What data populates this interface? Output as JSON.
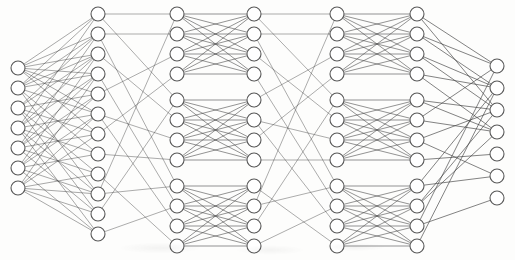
{
  "figure": {
    "caption": "",
    "width": 515,
    "height": 260,
    "background_color": "#fdfdfc",
    "node_fill": "#ffffff",
    "node_stroke": "#585858",
    "edge_color": "#3a3a3a"
  },
  "network": {
    "layer_count": 7,
    "layer_sizes": [
      7,
      12,
      12,
      12,
      12,
      12,
      7
    ],
    "node_radius": 7,
    "layers": [
      {
        "name": "input-layer",
        "role": "input",
        "node_count": 7,
        "x": 18,
        "y_start": 68,
        "y_step": 20,
        "group_gaps": []
      },
      {
        "name": "hidden-layer-1",
        "role": "hidden",
        "node_count": 12,
        "x": 98,
        "y_start": 14,
        "y_step": 20,
        "group_gaps": []
      },
      {
        "name": "hidden-layer-2",
        "role": "hidden",
        "node_count": 12,
        "x": 177,
        "y_start": 14,
        "y_step": 20,
        "group_gaps": [
          4,
          8
        ]
      },
      {
        "name": "hidden-layer-3",
        "role": "hidden",
        "node_count": 12,
        "x": 254,
        "y_start": 14,
        "y_step": 20,
        "group_gaps": [
          4,
          8
        ]
      },
      {
        "name": "hidden-layer-4",
        "role": "hidden",
        "node_count": 12,
        "x": 337,
        "y_start": 14,
        "y_step": 20,
        "group_gaps": [
          4,
          8
        ]
      },
      {
        "name": "hidden-layer-5",
        "role": "hidden",
        "node_count": 12,
        "x": 417,
        "y_start": 14,
        "y_step": 20,
        "group_gaps": [
          4,
          8
        ]
      },
      {
        "name": "output-layer",
        "role": "output",
        "node_count": 7,
        "x": 497,
        "y_start": 66,
        "y_step": 22,
        "group_gaps": []
      }
    ],
    "connections": [
      {
        "name": "input-to-hidden1",
        "from": 0,
        "to": 1,
        "style": "edge-input",
        "pattern": "sparse-random",
        "edges": [
          [
            0,
            0
          ],
          [
            0,
            1
          ],
          [
            0,
            2
          ],
          [
            0,
            3
          ],
          [
            0,
            4
          ],
          [
            0,
            5
          ],
          [
            0,
            6
          ],
          [
            1,
            0
          ],
          [
            1,
            1
          ],
          [
            1,
            2
          ],
          [
            1,
            3
          ],
          [
            1,
            5
          ],
          [
            1,
            7
          ],
          [
            1,
            9
          ],
          [
            2,
            1
          ],
          [
            2,
            2
          ],
          [
            2,
            4
          ],
          [
            2,
            6
          ],
          [
            2,
            8
          ],
          [
            2,
            10
          ],
          [
            3,
            0
          ],
          [
            3,
            2
          ],
          [
            3,
            3
          ],
          [
            3,
            5
          ],
          [
            3,
            7
          ],
          [
            3,
            9
          ],
          [
            3,
            11
          ],
          [
            4,
            1
          ],
          [
            4,
            3
          ],
          [
            4,
            4
          ],
          [
            4,
            6
          ],
          [
            4,
            8
          ],
          [
            4,
            10
          ],
          [
            5,
            2
          ],
          [
            5,
            4
          ],
          [
            5,
            5
          ],
          [
            5,
            7
          ],
          [
            5,
            9
          ],
          [
            5,
            11
          ],
          [
            6,
            3
          ],
          [
            6,
            5
          ],
          [
            6,
            6
          ],
          [
            6,
            8
          ],
          [
            6,
            9
          ],
          [
            6,
            10
          ],
          [
            6,
            11
          ]
        ]
      },
      {
        "name": "hidden1-to-hidden2-shuffle",
        "from": 1,
        "to": 2,
        "style": "edge-shuffle",
        "pattern": "shuffle-permutation",
        "edges": [
          [
            0,
            0
          ],
          [
            0,
            4
          ],
          [
            1,
            8
          ],
          [
            1,
            1
          ],
          [
            2,
            5
          ],
          [
            3,
            9
          ],
          [
            4,
            2
          ],
          [
            5,
            6
          ],
          [
            5,
            10
          ],
          [
            6,
            3
          ],
          [
            7,
            7
          ],
          [
            8,
            11
          ],
          [
            9,
            0
          ],
          [
            9,
            8
          ],
          [
            10,
            4
          ],
          [
            11,
            9
          ]
        ]
      },
      {
        "name": "hidden2-to-hidden3-dense-blocks",
        "from": 2,
        "to": 3,
        "style": "edge-dense",
        "pattern": "block-dense-4",
        "block_size": 4
      },
      {
        "name": "hidden3-to-hidden4-shuffle",
        "from": 3,
        "to": 4,
        "style": "edge-shuffle",
        "pattern": "shuffle-permutation",
        "edges": [
          [
            0,
            0
          ],
          [
            0,
            4
          ],
          [
            1,
            8
          ],
          [
            1,
            1
          ],
          [
            2,
            5
          ],
          [
            3,
            9
          ],
          [
            4,
            2
          ],
          [
            5,
            6
          ],
          [
            5,
            10
          ],
          [
            6,
            3
          ],
          [
            7,
            7
          ],
          [
            8,
            11
          ],
          [
            9,
            0
          ],
          [
            9,
            8
          ],
          [
            10,
            4
          ],
          [
            11,
            9
          ]
        ]
      },
      {
        "name": "hidden4-to-hidden5-dense-blocks",
        "from": 4,
        "to": 5,
        "style": "edge-dense",
        "pattern": "block-dense-4",
        "block_size": 4
      },
      {
        "name": "hidden5-to-output",
        "from": 5,
        "to": 6,
        "style": "edge-output",
        "pattern": "sparse-random",
        "edges": [
          [
            0,
            0
          ],
          [
            0,
            2
          ],
          [
            1,
            0
          ],
          [
            1,
            1
          ],
          [
            2,
            1
          ],
          [
            2,
            2
          ],
          [
            3,
            1
          ],
          [
            3,
            3
          ],
          [
            4,
            2
          ],
          [
            4,
            3
          ],
          [
            5,
            3
          ],
          [
            5,
            0
          ],
          [
            6,
            2
          ],
          [
            6,
            5
          ],
          [
            7,
            4
          ],
          [
            8,
            1
          ],
          [
            8,
            5
          ],
          [
            9,
            3
          ],
          [
            9,
            2
          ],
          [
            10,
            0
          ],
          [
            10,
            6
          ],
          [
            11,
            1
          ]
        ]
      }
    ]
  }
}
